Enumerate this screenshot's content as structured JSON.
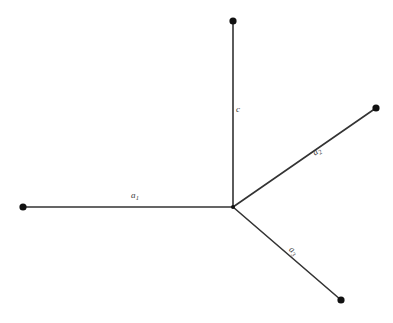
{
  "figure": {
    "type": "node-edge-diagram",
    "background_color": "#ffffff",
    "line_color": "#333333",
    "node_color": "#111111",
    "label_color": "#3a3a3a",
    "width": 393,
    "height": 323
  },
  "junction": {
    "name": "center-junction",
    "x": 233,
    "y": 207
  },
  "nodes": [
    {
      "id": "node-top",
      "x": 233,
      "y": 21,
      "radius": 3.6
    },
    {
      "id": "node-left",
      "x": 23,
      "y": 207,
      "radius": 3.6
    },
    {
      "id": "node-upper-right",
      "x": 376,
      "y": 108,
      "radius": 3.6
    },
    {
      "id": "node-lower-right",
      "x": 341,
      "y": 300,
      "radius": 3.6
    },
    {
      "id": "node-center",
      "x": 233,
      "y": 207,
      "radius": 2.2
    }
  ],
  "edges": [
    {
      "id": "edge-c",
      "label_base": "c",
      "label_sub": "",
      "x1": 233,
      "y1": 207,
      "x2": 233,
      "y2": 21,
      "label_x": 239,
      "label_y": 110,
      "rotation_deg": 0
    },
    {
      "id": "edge-a1",
      "label_base": "a",
      "label_sub": "1",
      "x1": 233,
      "y1": 207,
      "x2": 23,
      "y2": 207,
      "label_x": 138,
      "label_y": 196,
      "rotation_deg": 0
    },
    {
      "id": "edge-a2",
      "label_base": "a",
      "label_sub": "2",
      "x1": 233,
      "y1": 207,
      "x2": 376,
      "y2": 108,
      "label_x": 319,
      "label_y": 156,
      "rotation_deg": -34.7
    },
    {
      "id": "edge-a3",
      "label_base": "a",
      "label_sub": "3",
      "x1": 233,
      "y1": 207,
      "x2": 341,
      "y2": 300,
      "label_x": 300,
      "label_y": 250,
      "rotation_deg": 40.7
    }
  ],
  "labels": {
    "c": {
      "text": "c",
      "sub": ""
    },
    "a1": {
      "text": "a",
      "sub": "1"
    },
    "a2": {
      "text": "a",
      "sub": "2"
    },
    "a3": {
      "text": "a",
      "sub": "3"
    }
  }
}
